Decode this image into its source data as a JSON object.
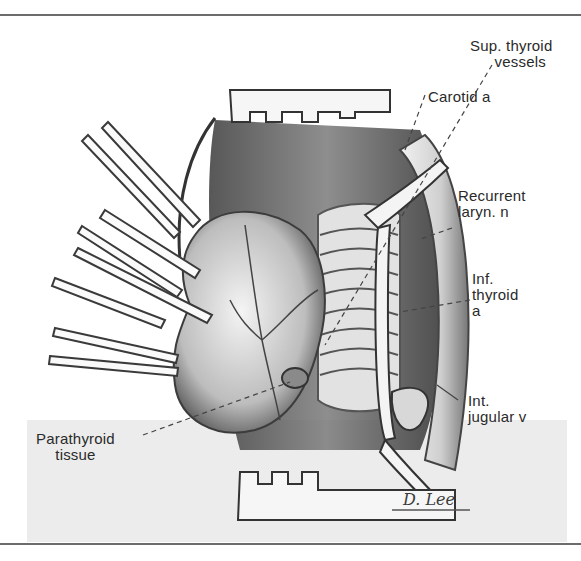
{
  "figure": {
    "signature": "D. Lee",
    "labels": [
      {
        "id": "sup-thyroid-vessels",
        "lines": [
          "Sup. thyroid",
          "vessels"
        ]
      },
      {
        "id": "carotid-a",
        "lines": [
          "Carotid a"
        ]
      },
      {
        "id": "recurrent-laryn-n",
        "lines": [
          "Recurrent",
          "laryn. n"
        ]
      },
      {
        "id": "inf-thyroid-a",
        "lines": [
          "Inf.",
          "thyroid",
          "a"
        ]
      },
      {
        "id": "int-jugular-v",
        "lines": [
          "Int.",
          "jugular v"
        ]
      },
      {
        "id": "parathyroid-tissue",
        "lines": [
          "Parathyroid",
          "tissue"
        ]
      }
    ]
  },
  "colors": {
    "ink": "#2a2a2a",
    "rule": "#6b6b6b",
    "shade": "#ececec"
  }
}
